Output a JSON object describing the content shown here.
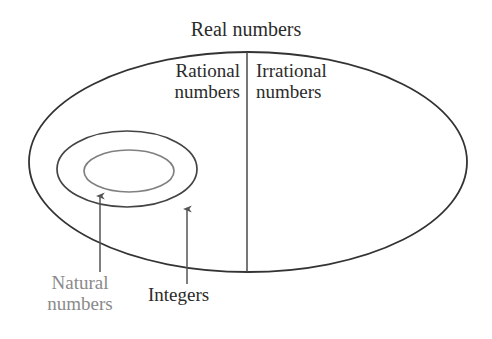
{
  "diagram": {
    "type": "venn-euler",
    "title": "Real numbers",
    "background_color": "#ffffff",
    "labels": {
      "real_numbers": "Real numbers",
      "rational_line1": "Rational",
      "rational_line2": "numbers",
      "irrational_line1": "Irrational",
      "irrational_line2": "numbers",
      "natural_line1": "Natural",
      "natural_line2": "numbers",
      "integers": "Integers"
    },
    "colors": {
      "outer_ellipse_stroke": "#333333",
      "middle_ellipse_stroke": "#444444",
      "inner_ellipse_stroke": "#808080",
      "divider_stroke": "#555555",
      "arrow_stroke": "#555555",
      "text_dark": "#2b2b2b",
      "text_gray": "#8a8a8a"
    },
    "shapes": {
      "outer_ellipse": {
        "cx": 248,
        "cy": 162,
        "rx": 219,
        "ry": 110
      },
      "middle_ellipse": {
        "cx": 127,
        "cy": 169,
        "rx": 70,
        "ry": 38
      },
      "inner_ellipse": {
        "cx": 129,
        "cy": 171,
        "rx": 45,
        "ry": 21
      },
      "divider": {
        "x": 247,
        "y1": 52,
        "y2": 272
      },
      "arrow_natural": {
        "x": 100,
        "y_tail": 272,
        "y_head": 191
      },
      "arrow_integers": {
        "x": 187,
        "y_tail": 284,
        "y_head": 204
      }
    }
  }
}
